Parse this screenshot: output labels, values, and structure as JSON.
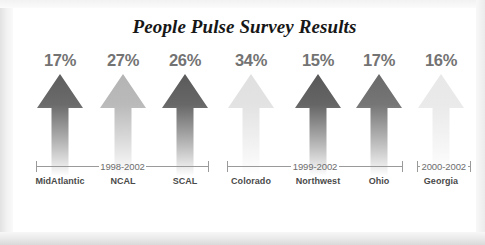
{
  "chart": {
    "title": "People Pulse Survey Results"
  },
  "chart_data": {
    "type": "bar",
    "title": "People Pulse Survey Results",
    "xlabel": "",
    "ylabel": "",
    "categories": [
      "MidAtlantic",
      "NCAL",
      "SCAL",
      "Colorado",
      "Northwest",
      "Ohio",
      "Georgia"
    ],
    "values": [
      17,
      27,
      26,
      34,
      15,
      17,
      16
    ],
    "value_labels": [
      "17%",
      "27%",
      "26%",
      "34%",
      "15%",
      "17%",
      "16%"
    ],
    "unit": "%",
    "grid": false,
    "legend": "none",
    "marker_style": "up-arrow",
    "note": "All arrows are drawn the same height; the numeric value is shown as a label above each arrow.",
    "series_colors": [
      "#5e5e5e",
      "#b4b4b4",
      "#5a5a5a",
      "#e0e0e0",
      "#585858",
      "#6a6a6a",
      "#e8e8e8"
    ],
    "groups": [
      {
        "label": "1998-2002",
        "categories": [
          "MidAtlantic",
          "NCAL",
          "SCAL"
        ]
      },
      {
        "label": "1999-2002",
        "categories": [
          "Colorado",
          "Northwest",
          "Ohio"
        ]
      },
      {
        "label": "2000-2002",
        "categories": [
          "Georgia"
        ]
      }
    ]
  },
  "colors": {
    "title": "#171717",
    "value_label": "#737373",
    "category_label": "#4a4a4a",
    "bracket": "#9a9a9a",
    "bracket_text": "#6e6e6e",
    "canvas": "#ffffff",
    "frame": "#eeeeee"
  }
}
